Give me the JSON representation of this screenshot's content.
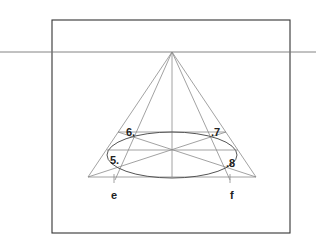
{
  "diagram": {
    "colors": {
      "frame": "#333333",
      "guide": "#8a8a8a",
      "ellipse": "#555555",
      "text": "#222222",
      "background": "#ffffff"
    },
    "horizon_y": 52,
    "vanishing_point": {
      "x": 172,
      "y": 52
    },
    "points": [
      {
        "label": "5.",
        "x": 110,
        "y": 160
      },
      {
        "label": "6.",
        "x": 126,
        "y": 128
      },
      {
        "label": ".7",
        "x": 211,
        "y": 128
      },
      {
        "label": ".8",
        "x": 226,
        "y": 160
      }
    ],
    "base_labels": [
      {
        "label": "e",
        "x": 111,
        "y": 190
      },
      {
        "label": "f",
        "x": 230,
        "y": 190
      }
    ]
  }
}
